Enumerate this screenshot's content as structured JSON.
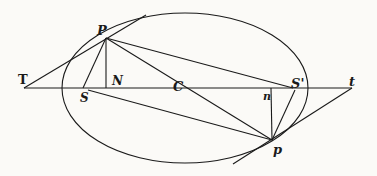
{
  "diagram": {
    "type": "ellipse-tangents",
    "ink_color": "#1a1a1a",
    "background": "#fbfaf7",
    "ellipse": {
      "cx": 185,
      "cy": 88,
      "rx": 123,
      "ry": 75
    },
    "points": {
      "P": {
        "label": "P",
        "x": 106,
        "y": 38
      },
      "N": {
        "label": "N",
        "x": 106,
        "y": 88
      },
      "S": {
        "label": "S",
        "x": 88,
        "y": 88
      },
      "C": {
        "label": "C",
        "x": 180,
        "y": 88
      },
      "T": {
        "label": "T",
        "x": 24,
        "y": 88
      },
      "S2": {
        "label": "S'",
        "x": 293,
        "y": 88
      },
      "n": {
        "label": "n",
        "x": 271,
        "y": 88
      },
      "t": {
        "label": "t",
        "x": 352,
        "y": 88
      },
      "p": {
        "label": "p",
        "x": 272,
        "y": 140
      }
    }
  }
}
